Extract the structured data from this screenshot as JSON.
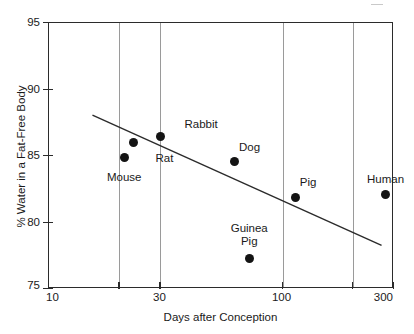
{
  "chart_data": {
    "type": "scatter",
    "title": "",
    "xlabel": "Days after Conception",
    "ylabel": "% Water in a Fat-Free Body",
    "xscale": "log",
    "xlim": [
      10,
      300
    ],
    "ylim": [
      75,
      95
    ],
    "grid": "vertical",
    "legend": "none",
    "xticks": [
      {
        "value": 10,
        "label": "10"
      },
      {
        "value": 20,
        "label": ""
      },
      {
        "value": 30,
        "label": "30"
      },
      {
        "value": 100,
        "label": "100"
      },
      {
        "value": 200,
        "label": ""
      },
      {
        "value": 300,
        "label": "300"
      }
    ],
    "yticks": [
      {
        "value": 75,
        "label": "75"
      },
      {
        "value": 80,
        "label": "80"
      },
      {
        "value": 85,
        "label": "85"
      },
      {
        "value": 90,
        "label": "90"
      },
      {
        "value": 95,
        "label": "95"
      }
    ],
    "points": [
      {
        "name": "Mouse",
        "label": "Mouse",
        "x": 21,
        "y": 84.9,
        "label_dx": 0,
        "label_dy": 20,
        "label_align": "center"
      },
      {
        "name": "Rat",
        "label": "Rat",
        "x": 23,
        "y": 86.0,
        "label_dx": 22,
        "label_dy": 15,
        "label_align": "left"
      },
      {
        "name": "Rabbit",
        "label": "Rabbit",
        "x": 30,
        "y": 86.5,
        "label_dx": 24,
        "label_dy": -12,
        "label_align": "left"
      },
      {
        "name": "Dog",
        "label": "Dog",
        "x": 62,
        "y": 84.6,
        "label_dx": 5,
        "label_dy": -14,
        "label_align": "left"
      },
      {
        "name": "Guinea Pig",
        "label": "Guinea\nPig",
        "x": 72,
        "y": 77.3,
        "label_dx": 0,
        "label_dy": -30,
        "label_align": "center"
      },
      {
        "name": "Pig",
        "label": "Pig",
        "x": 114,
        "y": 81.9,
        "label_dx": 4,
        "label_dy": -15,
        "label_align": "left"
      },
      {
        "name": "Human",
        "label": "Human",
        "x": 276,
        "y": 82.1,
        "label_dx": 0,
        "label_dy": -16,
        "label_align": "center"
      }
    ],
    "trendline": {
      "name": "regression-line",
      "x_start": 15.5,
      "y_start": 88.0,
      "x_end": 268,
      "y_end": 78.2
    },
    "series": [
      {
        "name": "Species water content",
        "x": [
          21,
          23,
          30,
          62,
          72,
          114,
          276
        ],
        "values": [
          84.9,
          86.0,
          86.5,
          84.6,
          77.3,
          81.9,
          82.1
        ],
        "categories": [
          "Mouse",
          "Rat",
          "Rabbit",
          "Dog",
          "Guinea Pig",
          "Pig",
          "Human"
        ]
      }
    ]
  }
}
